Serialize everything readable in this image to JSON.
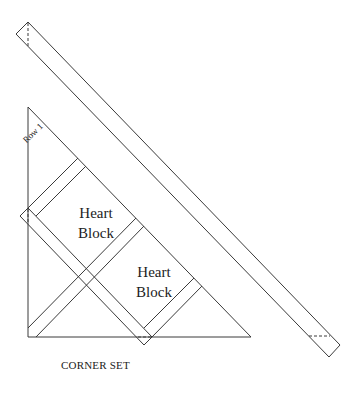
{
  "diagram": {
    "caption": "CORNER SET",
    "row_label": "Row 1",
    "blocks": [
      {
        "label_line1": "Heart",
        "label_line2": "Block"
      },
      {
        "label_line1": "Heart",
        "label_line2": "Block"
      }
    ],
    "line_color": "#3a3a3a",
    "background": "#ffffff"
  }
}
